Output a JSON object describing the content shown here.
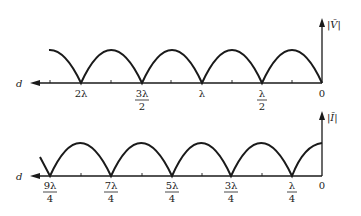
{
  "top_plot": {
    "y_label": "|V̄|",
    "x_label": "d",
    "tick_labels": [
      {
        "num": "2λ",
        "den": ""
      },
      {
        "num": "3λ",
        "den": "2"
      },
      {
        "num": "λ",
        "den": ""
      },
      {
        "num": "λ",
        "den": "2"
      },
      {
        "num": "0",
        "den": ""
      }
    ]
  },
  "bottom_plot": {
    "y_label": "|Ī|",
    "x_label": "d",
    "tick_labels": [
      {
        "num": "9λ",
        "den": "4"
      },
      {
        "num": "7λ",
        "den": "4"
      },
      {
        "num": "5λ",
        "den": "4"
      },
      {
        "num": "3λ",
        "den": "4"
      },
      {
        "num": "λ",
        "den": "4"
      },
      {
        "num": "0",
        "den": ""
      }
    ]
  },
  "colors": {
    "ink": "#1a1a1a",
    "background": "#ffffff"
  }
}
